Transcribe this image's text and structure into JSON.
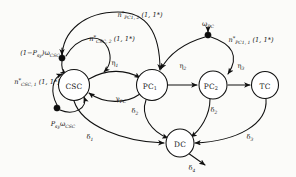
{
  "diagram": {
    "background_color": "#fbfbf9",
    "stroke_color": "#101010",
    "node_fill": "#ffffff",
    "nodes": [
      {
        "id": "CSC",
        "label": "CSC",
        "sub": "",
        "cx": 74,
        "cy": 85,
        "r": 15.5
      },
      {
        "id": "PC1",
        "label": "PC",
        "sub": "1",
        "cx": 152,
        "cy": 85,
        "r": 15.5
      },
      {
        "id": "PC2",
        "label": "PC",
        "sub": "2",
        "cx": 213,
        "cy": 85,
        "r": 14.0
      },
      {
        "id": "TC",
        "label": "TC",
        "sub": "",
        "cx": 265,
        "cy": 85,
        "r": 13.5
      },
      {
        "id": "DC",
        "label": "DC",
        "sub": "",
        "cx": 180,
        "cy": 143,
        "r": 14.0
      }
    ],
    "branch_points": [
      {
        "id": "csc-upper-dot",
        "cx": 62,
        "cy": 58,
        "r": 3.1
      },
      {
        "id": "csc-lower-dot",
        "cx": 57,
        "cy": 108,
        "r": 3.1
      },
      {
        "id": "pc-dot",
        "cx": 208,
        "cy": 35,
        "r": 3.1
      }
    ],
    "edge_labels": [
      {
        "id": "n-pc1-2",
        "base": "n",
        "star": "*",
        "sub": "PC1, 2",
        "args": "(1, 1*)",
        "x": 140,
        "y": 15
      },
      {
        "id": "n-csc-2",
        "base": "n",
        "star": "*",
        "sub": "CSC, 2",
        "args": "(1, 1*)",
        "x": 112,
        "y": 39
      },
      {
        "id": "n-csc-1",
        "base": "n",
        "star": "*",
        "sub": "CSC, 1",
        "args": "(1, 1*)",
        "x": 37,
        "y": 82
      },
      {
        "id": "n-pc1-1",
        "base": "n",
        "star": "*",
        "sub": "PC1, 1",
        "args": "(1, 1*)",
        "x": 251,
        "y": 40
      },
      {
        "id": "w-csc-neg",
        "text": "(1-Psy)ωCSC",
        "x": 40,
        "y": 53
      },
      {
        "id": "w-csc-pos",
        "text": "PsyωCSC",
        "x": 63,
        "y": 124
      },
      {
        "id": "w-pc",
        "text": "ωPC",
        "x": 210,
        "y": 24
      },
      {
        "id": "eta1",
        "text": "η1",
        "x": 115,
        "y": 63
      },
      {
        "id": "eta2",
        "text": "η2",
        "x": 183,
        "y": 66
      },
      {
        "id": "eta3",
        "text": "η3",
        "x": 241,
        "y": 66
      },
      {
        "id": "gamma-pc",
        "text": "γPC",
        "x": 121,
        "y": 99
      },
      {
        "id": "delta1",
        "text": "δ1",
        "x": 90,
        "y": 137
      },
      {
        "id": "delta2-a",
        "text": "δ2",
        "x": 135,
        "y": 111
      },
      {
        "id": "delta2-b",
        "text": "δ2",
        "x": 214,
        "y": 110
      },
      {
        "id": "delta3",
        "text": "δ3",
        "x": 250,
        "y": 137
      },
      {
        "id": "delta4",
        "text": "δ4",
        "x": 192,
        "y": 168
      }
    ],
    "symbols": {
      "n_base": "n",
      "star": "*",
      "args": "(1, 1*)",
      "omega": "ω",
      "eta": "η",
      "gamma": "γ",
      "delta": "δ",
      "P_prefix": "P",
      "P_sub": "sy",
      "one_minus_open": "(1−",
      "one_minus_close": ")",
      "sub_CSC": "CSC",
      "sub_PC": "PC",
      "sub_PC1": "PC",
      "idx_1": "1",
      "idx_2": "2",
      "idx_3": "3",
      "idx_4": "4"
    }
  }
}
